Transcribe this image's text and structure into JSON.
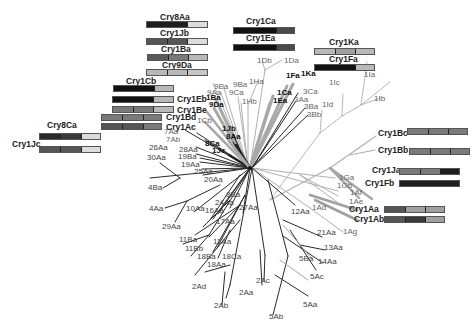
{
  "figure": {
    "type": "phylogenetic-tree",
    "colors": {
      "black": "#1e1e1e",
      "dark": "#4a4a4a",
      "mid": "#7a7a7a",
      "light": "#b8b8b8",
      "pale": "#dcdcdc",
      "branch_black": "#222222",
      "branch_gray": "#9a9a9a",
      "branch_light": "#b5b5b5"
    },
    "domain_bars": [
      {
        "name": "Cry8Aa",
        "segments": [
          "black",
          "black",
          "pale"
        ]
      },
      {
        "name": "Cry1Jb",
        "segments": [
          "dark",
          "dark",
          "pale"
        ]
      },
      {
        "name": "Cry1Ba",
        "segments": [
          "dark",
          "mid",
          "light"
        ]
      },
      {
        "name": "Cry9Da",
        "segments": [
          "light",
          "light",
          "light"
        ]
      },
      {
        "name": "Cry1Cb",
        "segments": [
          "black",
          "black",
          "light"
        ]
      },
      {
        "name": "Cry1Eb",
        "segments": [
          "black",
          "black",
          "light"
        ]
      },
      {
        "name": "Cry1Be",
        "segments": [
          "mid",
          "mid",
          "light"
        ]
      },
      {
        "name": "Cry1Bd",
        "segments": [
          "mid",
          "mid",
          "mid"
        ]
      },
      {
        "name": "Cry1Ac",
        "segments": [
          "dark",
          "dark",
          "mid"
        ]
      },
      {
        "name": "Cry8Ca",
        "segments": [
          "black",
          "dark",
          "pale"
        ]
      },
      {
        "name": "Cry1Jc",
        "segments": [
          "dark",
          "dark",
          "pale"
        ]
      },
      {
        "name": "Cry1Ca",
        "segments": [
          "black",
          "black",
          "dark"
        ]
      },
      {
        "name": "Cry1Ea",
        "segments": [
          "black",
          "black",
          "dark"
        ]
      },
      {
        "name": "Cry1Ka",
        "segments": [
          "light",
          "mid",
          "light"
        ]
      },
      {
        "name": "Cry1Fa",
        "segments": [
          "black",
          "black",
          "light"
        ]
      },
      {
        "name": "Cry1Bc",
        "segments": [
          "mid",
          "mid",
          "mid"
        ]
      },
      {
        "name": "Cry1Bb",
        "segments": [
          "mid",
          "mid",
          "mid"
        ]
      },
      {
        "name": "Cry1Ja",
        "segments": [
          "mid",
          "mid",
          "black"
        ]
      },
      {
        "name": "Cry1Fb",
        "segments": [
          "black",
          "black",
          "black"
        ]
      },
      {
        "name": "Cry1Aa",
        "segments": [
          "dark",
          "light",
          "light"
        ]
      },
      {
        "name": "Cry1Ab",
        "segments": [
          "dark",
          "dark",
          "light"
        ]
      }
    ],
    "leaf_labels": {
      "bold": [
        "1Fa",
        "1Ka",
        "1Ca",
        "1Ea",
        "1Ba",
        "9Da",
        "1Jb",
        "8Aa",
        "8Ca",
        "1Jc"
      ],
      "normal": [
        "1Db",
        "1Da",
        "1Ha",
        "9Ba",
        "9Ea",
        "9Aa",
        "9Ca",
        "1Hb",
        "1Cb",
        "3Ca",
        "3Aa",
        "3Ba",
        "3Bb",
        "1Ic",
        "1Id",
        "1Ia",
        "1Ib",
        "7Aa",
        "7Ab",
        "26Aa",
        "28Aa",
        "19Ba",
        "19Aa",
        "30Aa",
        "25Aa",
        "20Aa",
        "4Ba",
        "4Aa",
        "10Aa",
        "29Aa",
        "9Ba2",
        "24Aa",
        "16Aa",
        "27Aa",
        "17Aa",
        "11Ba",
        "11Bb",
        "11Aa",
        "18Ba",
        "18Ca",
        "18Aa",
        "2Ad",
        "2Ab",
        "2Aa",
        "2Ac",
        "5Ab",
        "5Aa",
        "5Ac",
        "5Ba",
        "14Aa",
        "13Aa",
        "21Aa",
        "12Aa",
        "1Ad",
        "1Ag",
        "1Ae",
        "1Af",
        "1Gb",
        "1Ga"
      ]
    },
    "labels": {
      "l_1Db": "1Db",
      "l_1Da": "1Da",
      "l_1Fa": "1Fa",
      "l_1Ka": "1Ka",
      "l_1Ha": "1Ha",
      "l_9Ba": "9Ba",
      "l_9Ea": "9Ea",
      "l_9Aa": "9Aa",
      "l_9Ca": "9Ca",
      "l_1Hb": "1Hb",
      "l_1Ca": "1Ca",
      "l_1Ea": "1Ea",
      "l_3Ca": "3Ca",
      "l_3Aa": "3Aa",
      "l_3Ba": "3Ba",
      "l_3Bb": "3Bb",
      "l_1Ic": "1Ic",
      "l_1Id": "1Id",
      "l_1Ia": "1Ia",
      "l_1Ib": "1Ib",
      "l_1Ba": "1Ba",
      "l_9Da": "9Da",
      "l_1Cb": "1Cb",
      "l_1Jb": "1Jb",
      "l_8Aa": "8Aa",
      "l_7Aa": "7Aa",
      "l_7Ab": "7Ab",
      "l_8Ca": "8Ca",
      "l_1Jc": "1Jc",
      "l_26Aa": "26Aa",
      "l_28Aa": "28Aa",
      "l_19Ba": "19Ba",
      "l_19Aa": "19Aa",
      "l_30Aa": "30Aa",
      "l_25Aa": "25Aa",
      "l_20Aa": "20Aa",
      "l_4Ba": "4Ba",
      "l_4Aa": "4Aa",
      "l_10Aa": "10Aa",
      "l_29Aa": "29Aa",
      "l_8Ba": "8Ba",
      "l_24Aa": "24Aa",
      "l_16Aa": "16Aa",
      "l_27Aa": "27Aa",
      "l_17Aa": "17Aa",
      "l_11Ba": "11Ba",
      "l_11Bb": "11Bb",
      "l_11Aa": "11Aa",
      "l_18Ba": "18Ba",
      "l_18Ca": "18Ca",
      "l_18Aa": "18Aa",
      "l_2Ad": "2Ad",
      "l_2Ab": "2Ab",
      "l_2Aa": "2Aa",
      "l_2Ac": "2Ac",
      "l_5Ab": "5Ab",
      "l_5Aa": "5Aa",
      "l_5Ac": "5Ac",
      "l_5Ba": "5Ba",
      "l_14Aa": "14Aa",
      "l_13Aa": "13Aa",
      "l_21Aa": "21Aa",
      "l_12Aa": "12Aa",
      "l_1Ad": "1Ad",
      "l_1Ag": "1Ag",
      "l_1Ae": "1Ae",
      "l_1Af": "1Af",
      "l_1Gb": "1Gb",
      "l_1Ga": "1Ga",
      "t_Cry8Aa": "Cry8Aa",
      "t_Cry1Jb": "Cry1Jb",
      "t_Cry1Ba": "Cry1Ba",
      "t_Cry9Da": "Cry9Da",
      "t_Cry1Cb": "Cry1Cb",
      "t_Cry1Eb": "Cry1Eb",
      "t_Cry1Be": "Cry1Be",
      "t_Cry1Bd": "Cry1Bd",
      "t_Cry1Ac": "Cry1Ac",
      "t_Cry8Ca": "Cry8Ca",
      "t_Cry1Jc": "Cry1Jc",
      "t_Cry1Ca": "Cry1Ca",
      "t_Cry1Ea": "Cry1Ea",
      "t_Cry1Ka": "Cry1Ka",
      "t_Cry1Fa": "Cry1Fa",
      "t_Cry1Bc": "Cry1Bc",
      "t_Cry1Bb": "Cry1Bb",
      "t_Cry1Ja": "Cry1Ja",
      "t_Cry1Fb": "Cry1Fb",
      "t_Cry1Aa": "Cry1Aa",
      "t_Cry1Ab": "Cry1Ab"
    }
  }
}
